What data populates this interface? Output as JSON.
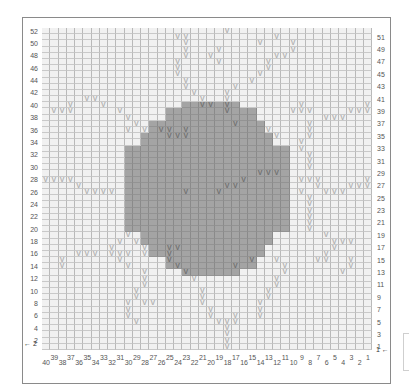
{
  "chart": {
    "columns": 40,
    "rows": 52,
    "colors": {
      "background": "#f1f1f1",
      "main_color_fill": "#a4a4a4",
      "grid_line": "#b9b9b9",
      "v_symbol_light": "#b0b0b0",
      "v_symbol_dark": "#707070",
      "label": "#555555"
    },
    "symbol_glyph": "V",
    "left_row_labels": [
      "52",
      "50",
      "48",
      "46",
      "44",
      "42",
      "40",
      "38",
      "36",
      "34",
      "32",
      "30",
      "28",
      "26",
      "24",
      "22",
      "20",
      "18",
      "16",
      "14",
      "12",
      "10",
      "8",
      "6",
      "4",
      "2"
    ],
    "right_row_labels": [
      "51",
      "49",
      "47",
      "45",
      "43",
      "41",
      "39",
      "37",
      "35",
      "33",
      "31",
      "29",
      "27",
      "25",
      "23",
      "21",
      "19",
      "17",
      "15",
      "13",
      "11",
      "9",
      "7",
      "5",
      "3",
      "1"
    ],
    "column_labels_bottom_row": [
      "40",
      "38",
      "36",
      "34",
      "32",
      "30",
      "28",
      "26",
      "24",
      "22",
      "20",
      "18",
      "16",
      "14",
      "12",
      "10",
      "8",
      "6",
      "4",
      "2"
    ],
    "column_labels_top_row": [
      "39",
      "37",
      "35",
      "33",
      "31",
      "29",
      "27",
      "25",
      "23",
      "21",
      "19",
      "17",
      "15",
      "13",
      "11",
      "9",
      "7",
      "5",
      "3",
      "1"
    ],
    "start_arrow_left": "← 2",
    "start_arrow_right": "1 ←",
    "legend": {
      "dark": "filled contrast color (sun)",
      "v": "contrast stitch (rays)",
      "blank": "background color"
    },
    "row_patterns": [
      "......................V.................",
      "................VV..........V...........",
      ".................V........V...V.........",
      ".................V...V........V.........",
      ".................V..V.......VV..........",
      "................V....V.....V............",
      "................V..........V............",
      "................V.........V.............",
      ".................V.......V..............",
      ".................V.....V................",
      "..................V...V.................",
      ".....VV............V..V.................",
      "...V...V...........VV.V........V.......V",
      ".VVV.....V............V.......VVV....VVV",
      "..........V.......................VVV...",
      "...........V...........V........V.......",
      "..........V.V.VV.V.........V....V.......",
      "...............VVV..........V...V.......",
      "...............................V........",
      "...............................V........",
      "................................V.......",
      "................................V.......",
      "................................V.......",
      "..........................VVV...........",
      "VVVV....................V......VVV.....V",
      "....V.................VV.........V...VVV",
      ".....VVVV........V...V.........V..VVV...",
      "................................V.......",
      "................................V.......",
      "................................V.......",
      "................................V.......",
      "................................V.......",
      "................................V.......",
      "..........V.......................V.....",
      ".........V.V.......................VVV..",
      "........V...V..VV..................V....",
      "....VVV.VVV.V..V..................V.....",
      "..V......V.....V.........V..V....VV..V..",
      "..V.......V.....V......V.....V.......V..",
      "............V....V...........V......V...",
      "............V.....V.........V...........",
      "............V...............V...........",
      "...........V.......V.......V............",
      "...........V.......V.......V............",
      "..........V.VV.....V......V.............",
      "..........V.........V.....V.............",
      "..........V.........V..V..V.............",
      "...........V.........VVV................",
      "......................V.................",
      "......................V.................",
      "......................V.................",
      "......................V................."
    ],
    "dark_rows": [
      {
        "row": 40,
        "from": 17,
        "to": 23
      },
      {
        "row": 39,
        "from": 15,
        "to": 25
      },
      {
        "row": 38,
        "from": 15,
        "to": 25
      },
      {
        "row": 37,
        "from": 13,
        "to": 26
      },
      {
        "row": 36,
        "from": 13,
        "to": 26
      },
      {
        "row": 35,
        "from": 12,
        "to": 27
      },
      {
        "row": 34,
        "from": 12,
        "to": 27
      },
      {
        "row": 33,
        "from": 10,
        "to": 29
      },
      {
        "row": 32,
        "from": 10,
        "to": 29
      },
      {
        "row": 31,
        "from": 10,
        "to": 29
      },
      {
        "row": 30,
        "from": 10,
        "to": 29
      },
      {
        "row": 29,
        "from": 10,
        "to": 29
      },
      {
        "row": 28,
        "from": 10,
        "to": 29
      },
      {
        "row": 27,
        "from": 10,
        "to": 29
      },
      {
        "row": 26,
        "from": 10,
        "to": 29
      },
      {
        "row": 25,
        "from": 10,
        "to": 29
      },
      {
        "row": 24,
        "from": 10,
        "to": 29
      },
      {
        "row": 23,
        "from": 10,
        "to": 29
      },
      {
        "row": 22,
        "from": 10,
        "to": 29
      },
      {
        "row": 21,
        "from": 10,
        "to": 29
      },
      {
        "row": 20,
        "from": 10,
        "to": 29
      },
      {
        "row": 19,
        "from": 12,
        "to": 27
      },
      {
        "row": 18,
        "from": 12,
        "to": 27
      },
      {
        "row": 17,
        "from": 13,
        "to": 26
      },
      {
        "row": 16,
        "from": 13,
        "to": 26
      },
      {
        "row": 15,
        "from": 15,
        "to": 25
      },
      {
        "row": 14,
        "from": 15,
        "to": 25
      },
      {
        "row": 13,
        "from": 17,
        "to": 23
      }
    ]
  }
}
